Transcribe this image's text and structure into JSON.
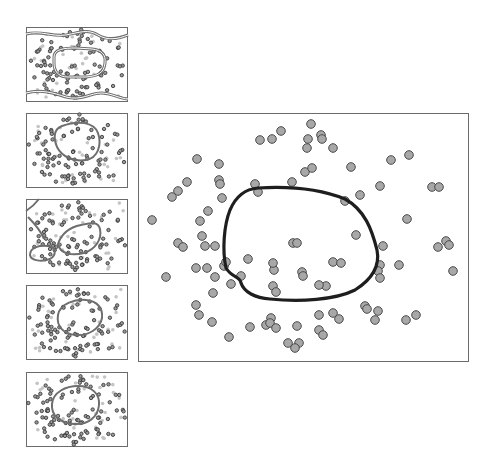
{
  "figure": {
    "colors": {
      "panel_border": "#6b6b6b",
      "point_fill": "#a8a8a8",
      "point_stroke": "#4a4a4a",
      "light_point": "#c4c4c4",
      "thumb_curve": "#6e6e6e",
      "main_curve": "#1e1e1e"
    }
  },
  "thumbnails": [
    {
      "id": "thumb-1",
      "x": 26,
      "y": 27,
      "w": 102,
      "h": 75,
      "boundary": "double-line band + outer waves"
    },
    {
      "id": "thumb-2",
      "x": 26,
      "y": 113,
      "w": 102,
      "h": 75,
      "boundary": "loop ellipse"
    },
    {
      "id": "thumb-3",
      "x": 26,
      "y": 199,
      "w": 102,
      "h": 75,
      "boundary": "two-lobe irregular"
    },
    {
      "id": "thumb-4",
      "x": 26,
      "y": 285,
      "w": 102,
      "h": 75,
      "boundary": "ellipse"
    },
    {
      "id": "thumb-5",
      "x": 26,
      "y": 372,
      "w": 102,
      "h": 75,
      "boundary": "ellipse"
    }
  ],
  "main_panel": {
    "x": 138,
    "y": 113,
    "w": 331,
    "h": 249,
    "points": [
      [
        311,
        124
      ],
      [
        260,
        140
      ],
      [
        272,
        139
      ],
      [
        281,
        131
      ],
      [
        308,
        139
      ],
      [
        321,
        135
      ],
      [
        322,
        139
      ],
      [
        307,
        148
      ],
      [
        333,
        148
      ],
      [
        305,
        172
      ],
      [
        312,
        168
      ],
      [
        351,
        167
      ],
      [
        255,
        184
      ],
      [
        292,
        182
      ],
      [
        380,
        186
      ],
      [
        197,
        159
      ],
      [
        219,
        164
      ],
      [
        187,
        182
      ],
      [
        219,
        180
      ],
      [
        220,
        184
      ],
      [
        178,
        191
      ],
      [
        172,
        197
      ],
      [
        222,
        198
      ],
      [
        208,
        211
      ],
      [
        152,
        220
      ],
      [
        200,
        221
      ],
      [
        202,
        236
      ],
      [
        391,
        160
      ],
      [
        409,
        155
      ],
      [
        432,
        187
      ],
      [
        439,
        187
      ],
      [
        360,
        195
      ],
      [
        407,
        219
      ],
      [
        178,
        243
      ],
      [
        183,
        247
      ],
      [
        205,
        246
      ],
      [
        215,
        246
      ],
      [
        196,
        268
      ],
      [
        207,
        268
      ],
      [
        224,
        266
      ],
      [
        166,
        277
      ],
      [
        215,
        277
      ],
      [
        248,
        259
      ],
      [
        241,
        276
      ],
      [
        231,
        284
      ],
      [
        213,
        293
      ],
      [
        274,
        270
      ],
      [
        293,
        243
      ],
      [
        297,
        243
      ],
      [
        273,
        263
      ],
      [
        273,
        286
      ],
      [
        276,
        292
      ],
      [
        196,
        305
      ],
      [
        199,
        315
      ],
      [
        212,
        322
      ],
      [
        229,
        337
      ],
      [
        250,
        327
      ],
      [
        266,
        325
      ],
      [
        271,
        318
      ],
      [
        270,
        323
      ],
      [
        276,
        328
      ],
      [
        297,
        326
      ],
      [
        288,
        343
      ],
      [
        299,
        343
      ],
      [
        295,
        348
      ],
      [
        356,
        235
      ],
      [
        383,
        246
      ],
      [
        380,
        265
      ],
      [
        378,
        271
      ],
      [
        380,
        278
      ],
      [
        399,
        265
      ],
      [
        438,
        247
      ],
      [
        446,
        241
      ],
      [
        449,
        245
      ],
      [
        453,
        271
      ],
      [
        333,
        262
      ],
      [
        302,
        272
      ],
      [
        303,
        276
      ],
      [
        326,
        286
      ],
      [
        341,
        263
      ],
      [
        319,
        285
      ],
      [
        378,
        311
      ],
      [
        319,
        315
      ],
      [
        333,
        313
      ],
      [
        339,
        319
      ],
      [
        319,
        330
      ],
      [
        323,
        335
      ],
      [
        365,
        306
      ],
      [
        367,
        309
      ],
      [
        375,
        320
      ],
      [
        406,
        320
      ],
      [
        416,
        315
      ],
      [
        345,
        201
      ],
      [
        258,
        192
      ],
      [
        226,
        262
      ]
    ],
    "boundary_path": "M 258 188 C 290 186, 320 189, 345 199 C 365 210, 372 230, 377 250 C 380 265, 374 278, 355 290 C 335 300, 300 302, 270 299 C 255 298, 244 292, 241 283 C 240 276, 232 278, 226 268 C 222 250, 224 225, 230 210 C 236 196, 245 189, 258 188 Z"
  }
}
